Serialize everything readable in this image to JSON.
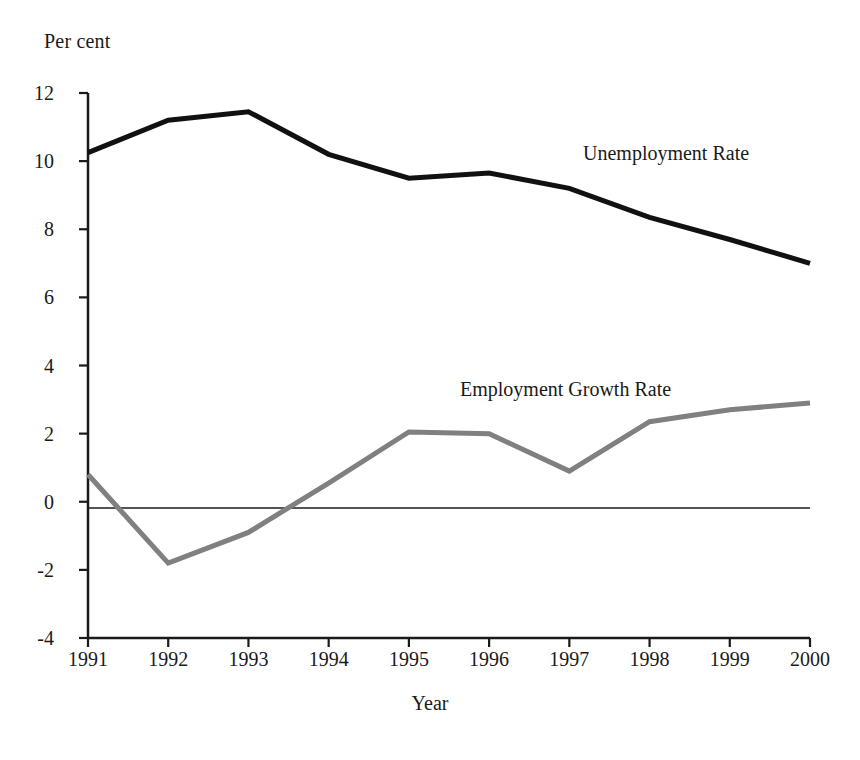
{
  "chart_data": {
    "type": "line",
    "title": "",
    "subtitle": "",
    "xlabel": "Year",
    "ylabel": "Per cent",
    "ylabel_position": "top-left",
    "grid": false,
    "legend": "inline-annotations",
    "categories": [
      "1991",
      "1992",
      "1993",
      "1994",
      "1995",
      "1996",
      "1997",
      "1998",
      "1999",
      "2000"
    ],
    "x": [
      1991,
      1992,
      1993,
      1994,
      1995,
      1996,
      1997,
      1998,
      1999,
      2000
    ],
    "xlim": [
      1991,
      2000
    ],
    "ylim": [
      -4,
      12
    ],
    "ytick_values": [
      12,
      10,
      8,
      6,
      4,
      2,
      0,
      -2,
      -4
    ],
    "ytick_labels": [
      "12",
      "10",
      "8",
      "6",
      "4",
      "2",
      "0",
      "-2",
      "-4"
    ],
    "ytick_step": 2,
    "zero_line": 0,
    "series": [
      {
        "name": "Unemployment Rate",
        "color": "#111111",
        "line_width": 5,
        "values": [
          10.25,
          11.2,
          11.45,
          10.2,
          9.5,
          9.65,
          9.2,
          8.35,
          7.7,
          7.0
        ]
      },
      {
        "name": "Employment Growth Rate",
        "color": "#808080",
        "line_width": 5,
        "values": [
          0.8,
          -1.8,
          -0.9,
          0.55,
          2.05,
          2.0,
          0.9,
          2.35,
          2.7,
          2.9
        ]
      }
    ],
    "annotations": [
      {
        "text": "Unemployment Rate",
        "series": "Unemployment Rate"
      },
      {
        "text": "Employment Growth Rate",
        "series": "Employment Growth Rate"
      }
    ]
  },
  "axis": {
    "unit_label": "Per cent",
    "x_title": "Year"
  }
}
